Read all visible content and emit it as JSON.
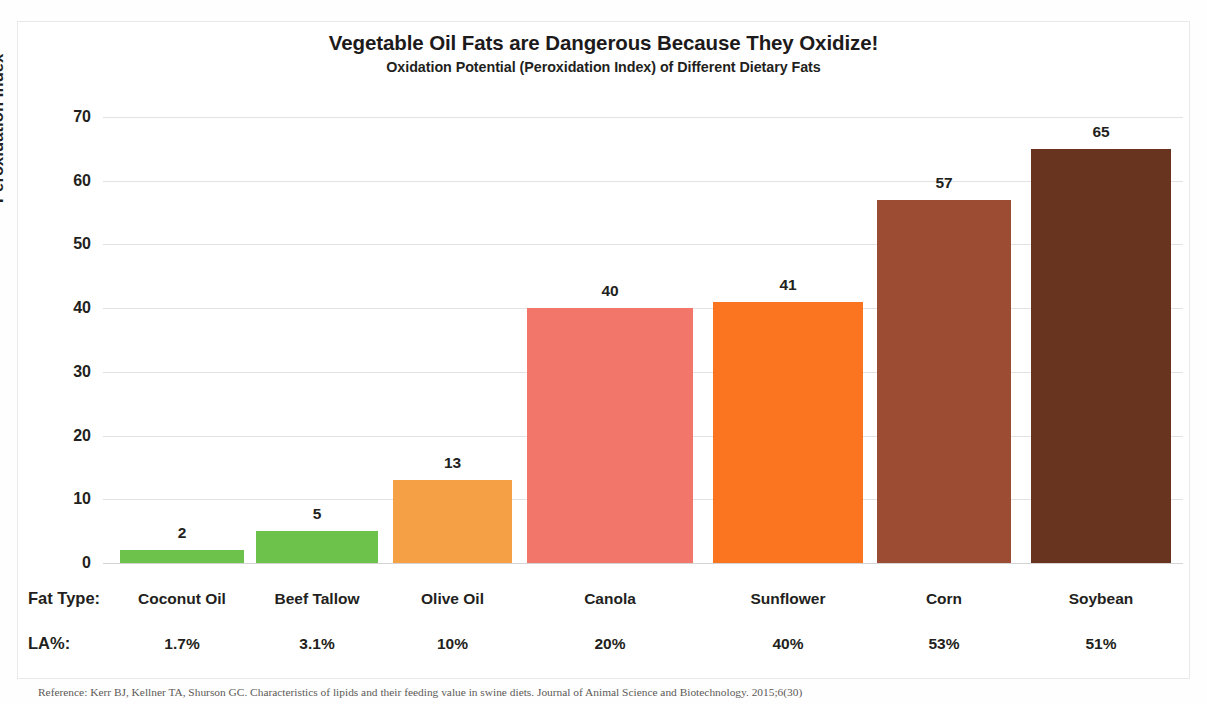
{
  "chart_data": {
    "type": "bar",
    "title": "Vegetable Oil Fats are Dangerous Because They Oxidize!",
    "subtitle": "Oxidation Potential (Peroxidation Index) of Different Dietary Fats",
    "xlabel": "",
    "ylabel": "Peroxidation Index",
    "ylim": [
      0,
      70
    ],
    "yticks": [
      0,
      10,
      20,
      30,
      40,
      50,
      60,
      70
    ],
    "grid": true,
    "legend": "none",
    "categories": [
      "Coconut Oil",
      "Beef Tallow",
      "Olive Oil",
      "Canola",
      "Sunflower",
      "Corn",
      "Soybean"
    ],
    "values": [
      2,
      5,
      13,
      40,
      41,
      57,
      65
    ],
    "data_labels": [
      "2",
      "5",
      "13",
      "40",
      "41",
      "57",
      "65"
    ],
    "bar_colors": [
      "#6cc24a",
      "#6cc24a",
      "#f5a044",
      "#f2766a",
      "#fb7521",
      "#9b4c33",
      "#68331f"
    ],
    "secondary_row": {
      "label": "LA%:",
      "values": [
        "1.7%",
        "3.1%",
        "10%",
        "20%",
        "40%",
        "53%",
        "51%"
      ]
    },
    "category_row_label": "Fat Type:"
  },
  "footer": {
    "reference": "Reference:  Kerr BJ, Kellner TA, Shurson GC. Characteristics of lipids and their feeding value in swine diets. Journal of Animal Science and Biotechnology. 2015;6(30)"
  },
  "colors": {
    "text": "#231f20",
    "gridline": "#e3e3e4",
    "frame": "#e9e9ea",
    "background": "#ffffff"
  }
}
